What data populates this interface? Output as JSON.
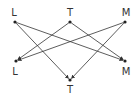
{
  "diagram": {
    "type": "bipartite-directed-graph",
    "colors": {
      "edge": "#333333",
      "node": "#222222",
      "label": "#333333",
      "background": "#ffffff"
    },
    "top_nodes": [
      {
        "id": "L_top",
        "label": "L",
        "x": 15,
        "y": 22,
        "lx": 14,
        "ly": 13
      },
      {
        "id": "T_top",
        "label": "T",
        "x": 70,
        "y": 22,
        "lx": 70,
        "ly": 13
      },
      {
        "id": "M_top",
        "label": "M",
        "x": 125,
        "y": 22,
        "lx": 126,
        "ly": 13
      }
    ],
    "bottom_nodes": [
      {
        "id": "L_bot",
        "label": "L",
        "x": 16,
        "y": 61,
        "lx": 15,
        "ly": 72
      },
      {
        "id": "M_bot",
        "label": "M",
        "x": 125,
        "y": 61,
        "lx": 126,
        "ly": 72
      },
      {
        "id": "T_bot",
        "label": "T",
        "x": 70,
        "y": 80,
        "lx": 70,
        "ly": 90
      }
    ],
    "edges": [
      {
        "from": "L_top",
        "to": "T_bot"
      },
      {
        "from": "L_top",
        "to": "M_bot"
      },
      {
        "from": "T_top",
        "to": "L_bot"
      },
      {
        "from": "T_top",
        "to": "M_bot"
      },
      {
        "from": "M_top",
        "to": "L_bot"
      },
      {
        "from": "M_top",
        "to": "T_bot"
      }
    ]
  }
}
